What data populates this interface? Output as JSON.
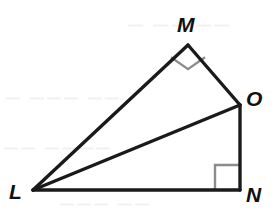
{
  "figure": {
    "kind": "geometry-diagram",
    "canvas": {
      "width": 277,
      "height": 219,
      "background": "#ffffff"
    },
    "stroke": {
      "color": "#1a1a1a",
      "width": 3,
      "right_angle_color": "#8c8c8c",
      "right_angle_width": 2
    },
    "vertices": [
      {
        "id": "L",
        "label": "L",
        "x": 33,
        "y": 190
      },
      {
        "id": "M",
        "label": "M",
        "x": 188,
        "y": 45
      },
      {
        "id": "O",
        "label": "O",
        "x": 240,
        "y": 105
      },
      {
        "id": "N",
        "label": "N",
        "x": 240,
        "y": 190
      }
    ],
    "segments": [
      {
        "id": "LM",
        "from": "L",
        "to": "M"
      },
      {
        "id": "MO",
        "from": "M",
        "to": "O"
      },
      {
        "id": "ON",
        "from": "O",
        "to": "N"
      },
      {
        "id": "NL",
        "from": "N",
        "to": "L"
      },
      {
        "id": "LO",
        "from": "L",
        "to": "O"
      }
    ],
    "right_angles": [
      {
        "id": "angle-M",
        "at": "M",
        "marker": "square",
        "rotated": true,
        "size": 17
      },
      {
        "id": "angle-N",
        "at": "N",
        "marker": "square",
        "rotated": false,
        "size": 25
      }
    ]
  },
  "labels": {
    "M": "M",
    "O": "O",
    "N": "N",
    "L": "L"
  },
  "background_artifacts": {
    "note": "faint scan ghost text barely visible behind the figure",
    "lines": [
      "— —— ——",
      "— ——— ——",
      "—— ————",
      "——— ——"
    ]
  }
}
